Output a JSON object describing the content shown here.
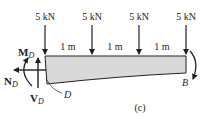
{
  "diagram": {
    "type": "free-body diagram of tapered cantilever segment",
    "panel_label": "(c)",
    "loads": [
      {
        "label": "5 kN",
        "x": 45
      },
      {
        "label": "5 kN",
        "x": 92
      },
      {
        "label": "5 kN",
        "x": 139
      },
      {
        "label": "5 kN",
        "x": 186
      }
    ],
    "spacings": [
      {
        "label": "1 m",
        "x": 68
      },
      {
        "label": "1 m",
        "x": 115
      },
      {
        "label": "1 m",
        "x": 162
      }
    ],
    "internal_forces": {
      "moment": {
        "symbol": "M",
        "sub": "D"
      },
      "normal": {
        "symbol": "N",
        "sub": "D"
      },
      "shear": {
        "symbol": "V",
        "sub": "D"
      }
    },
    "points": {
      "section": "D",
      "end": "B"
    },
    "colors": {
      "beam_fill": "#d9d9d9",
      "stroke": "#222222"
    }
  }
}
